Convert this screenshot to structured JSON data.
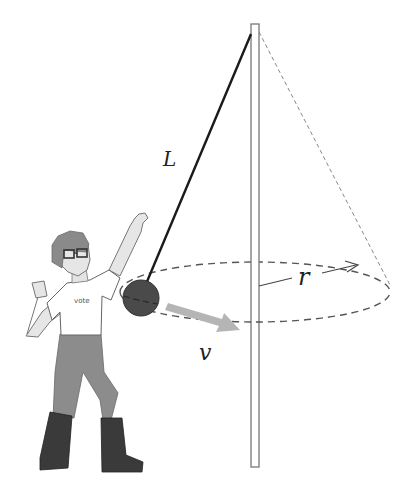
{
  "diagram": {
    "labels": {
      "length": "L",
      "radius": "r",
      "velocity": "v",
      "shirt_text": "vote"
    },
    "colors": {
      "string": "#1a1a1a",
      "ball": "#4a4a4a",
      "pole": "#777777",
      "dashed": "#555555",
      "velocity_arrow": "#b5b5b5",
      "skin": "#e3e3e3",
      "hair": "#8a8a8a",
      "pants": "#8c8c8c",
      "boots": "#3a3a3a"
    },
    "elements": [
      "vertical pole",
      "string of length L",
      "ball (tetherball)",
      "dashed circular path of radius r",
      "dashed cone line",
      "velocity arrow v",
      "person in vote t-shirt"
    ]
  }
}
